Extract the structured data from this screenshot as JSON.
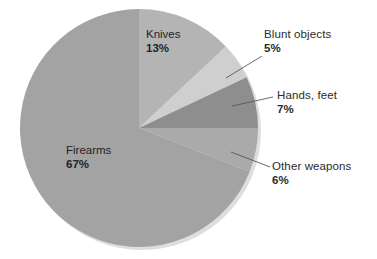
{
  "chart_data": {
    "type": "pie",
    "title": "",
    "subtitle": "",
    "xlabel": "",
    "ylabel": "",
    "legend_position": "none",
    "grid": false,
    "unit": "%",
    "total": 98,
    "categories": [
      "Firearms",
      "Knives",
      "Blunt objects",
      "Hands, feet",
      "Other weapons"
    ],
    "values": [
      67,
      13,
      5,
      7,
      6
    ],
    "slices": [
      {
        "name": "Knives",
        "value": 13,
        "value_label": "13%",
        "color": "#b4b4b4",
        "start_angle_deg": 0,
        "end_angle_deg": 46.8,
        "label_placement": "inside"
      },
      {
        "name": "Blunt objects",
        "value": 5,
        "value_label": "5%",
        "color": "#cfcfcf",
        "start_angle_deg": 46.8,
        "end_angle_deg": 64.8,
        "label_placement": "callout"
      },
      {
        "name": "Hands, feet",
        "value": 7,
        "value_label": "7%",
        "color": "#8e8e8e",
        "start_angle_deg": 64.8,
        "end_angle_deg": 90.0,
        "label_placement": "callout"
      },
      {
        "name": "Other weapons",
        "value": 6,
        "value_label": "6%",
        "color": "#aaaaaa",
        "start_angle_deg": 90.0,
        "end_angle_deg": 111.6,
        "label_placement": "callout"
      },
      {
        "name": "Firearms",
        "value": 67,
        "value_label": "67%",
        "color": "#a3a3a3",
        "start_angle_deg": 111.6,
        "end_angle_deg": 360,
        "label_placement": "inside"
      }
    ],
    "geometry": {
      "center_x": 139,
      "center_y": 128,
      "radius": 119
    },
    "colors": {
      "background": "#ffffff",
      "text": "#2b2b2b",
      "leader_line": "#5a5a5a",
      "shadow": "#dcdcdc"
    }
  },
  "labels": {
    "knives": {
      "name": "Knives",
      "value": "13%"
    },
    "firearms": {
      "name": "Firearms",
      "value": "67%"
    },
    "blunt": {
      "name": "Blunt objects",
      "value": "5%"
    },
    "hands": {
      "name": "Hands, feet",
      "value": "7%"
    },
    "other": {
      "name": "Other weapons",
      "value": "6%"
    }
  }
}
